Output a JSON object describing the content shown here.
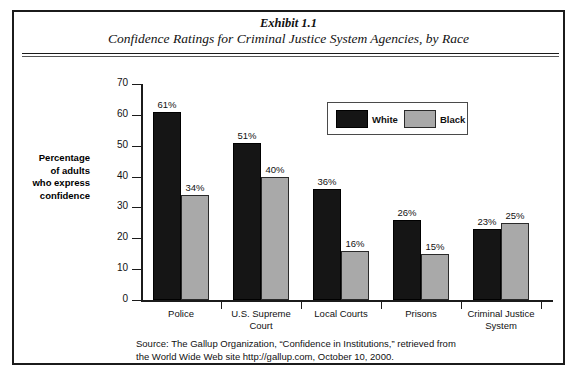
{
  "exhibit": {
    "number": "Exhibit 1.1",
    "subtitle": "Confidence Ratings for Criminal Justice System Agencies, by Race"
  },
  "legend": {
    "white_label": "White",
    "black_label": "Black"
  },
  "axis": {
    "ylabel": "Percentage of adults who express confidence",
    "ylabel_lines": [
      "Percentage",
      "of adults",
      "who express",
      "confidence"
    ]
  },
  "source": {
    "line1": "Source: The Gallup Organization, “Confidence in Institutions,” retrieved from",
    "line2": "the World Wide Web site http://gallup.com, October 10, 2000."
  },
  "colors": {
    "white_series": "#151515",
    "black_series": "#a9a9a9",
    "border": "#1b1b1b",
    "background": "#ffffff"
  },
  "chart_data": {
    "type": "bar",
    "title": "Confidence Ratings for Criminal Justice System Agencies, by Race",
    "xlabel": "",
    "ylabel": "Percentage of adults who express confidence",
    "ylim": [
      0,
      70
    ],
    "yticks": [
      0,
      10,
      20,
      30,
      40,
      50,
      60,
      70
    ],
    "ytick_labels": [
      "0",
      "10",
      "20",
      "30",
      "40",
      "50",
      "60",
      "70"
    ],
    "grid": false,
    "legend_position": "top-right",
    "categories": [
      "Police",
      "U.S. Supreme Court",
      "Local Courts",
      "Prisons",
      "Criminal Justice System"
    ],
    "category_lines": [
      [
        "Police"
      ],
      [
        "U.S. Supreme",
        "Court"
      ],
      [
        "Local Courts"
      ],
      [
        "Prisons"
      ],
      [
        "Criminal Justice",
        "System"
      ]
    ],
    "series": [
      {
        "name": "White",
        "color": "#151515",
        "values": [
          61,
          51,
          36,
          26,
          23
        ],
        "labels": [
          "61%",
          "51%",
          "36%",
          "26%",
          "23%"
        ]
      },
      {
        "name": "Black",
        "color": "#a9a9a9",
        "values": [
          34,
          40,
          16,
          15,
          25
        ],
        "labels": [
          "34%",
          "40%",
          "16%",
          "15%",
          "25%"
        ]
      }
    ]
  }
}
